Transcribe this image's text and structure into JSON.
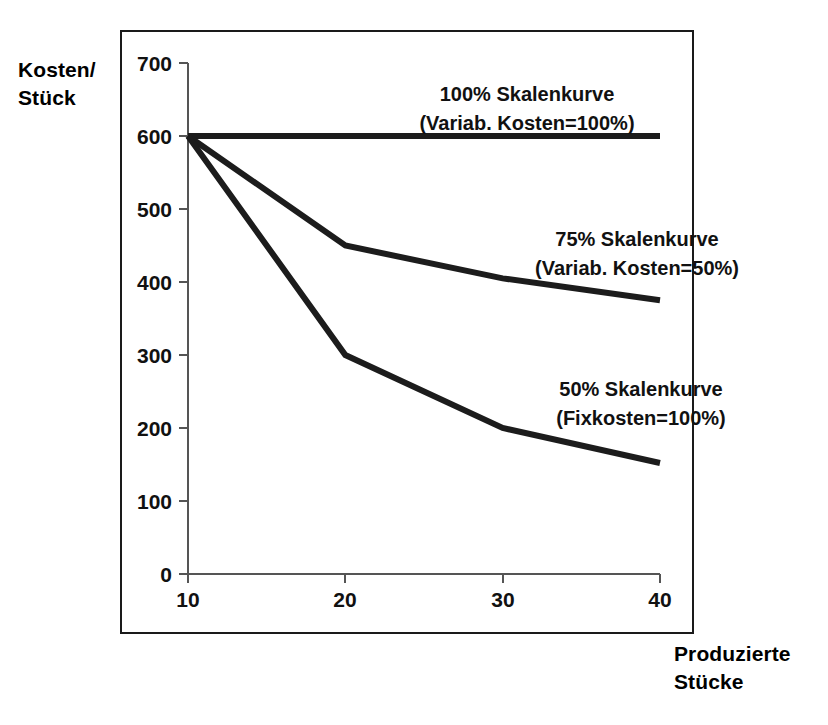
{
  "chart_data": {
    "type": "line",
    "title": "",
    "xlabel": "Produzierte\nStücke",
    "ylabel": "Kosten/\nStück",
    "x": [
      10,
      20,
      30,
      40
    ],
    "xticklabels": [
      "10",
      "20",
      "30",
      "40"
    ],
    "yticklabels": [
      "0",
      "100",
      "200",
      "300",
      "400",
      "500",
      "600",
      "700"
    ],
    "yticks": [
      0,
      100,
      200,
      300,
      400,
      500,
      600,
      700
    ],
    "xlim": [
      10,
      40
    ],
    "ylim": [
      0,
      700
    ],
    "grid": false,
    "legend_position": "inline-annotations",
    "series": [
      {
        "name": "100% Skalenkurve (Variab. Kosten=100%)",
        "label_line1": "100% Skalenkurve",
        "label_line2": "(Variab. Kosten=100%)",
        "values": [
          600,
          600,
          600,
          600
        ],
        "color": "#1c1c1c"
      },
      {
        "name": "75% Skalenkurve (Variab. Kosten=50%)",
        "label_line1": "75% Skalenkurve",
        "label_line2": "(Variab. Kosten=50%)",
        "values": [
          600,
          450,
          405,
          375
        ],
        "color": "#1c1c1c"
      },
      {
        "name": "50% Skalenkurve (Fixkosten=100%)",
        "label_line1": "50% Skalenkurve",
        "label_line2": "(Fixkosten=100%)",
        "values": [
          600,
          300,
          200,
          152
        ],
        "color": "#1c1c1c"
      }
    ]
  },
  "axes": {
    "y_title": "Kosten/\nStück",
    "x_title": "Produzierte\nStücke"
  },
  "ticks": {
    "y": [
      "700",
      "600",
      "500",
      "400",
      "300",
      "200",
      "100",
      "0"
    ],
    "x": [
      "10",
      "20",
      "30",
      "40"
    ]
  },
  "annotations": {
    "a1_line1": "100% Skalenkurve",
    "a1_line2": "(Variab. Kosten=100%)",
    "a2_line1": "75% Skalenkurve",
    "a2_line2": "(Variab. Kosten=50%)",
    "a3_line1": "50% Skalenkurve",
    "a3_line2": "(Fixkosten=100%)"
  },
  "colors": {
    "line": "#1c1c1c",
    "axis": "#555555",
    "frame": "#1a1a1a",
    "text": "#111111",
    "background": "#ffffff"
  }
}
